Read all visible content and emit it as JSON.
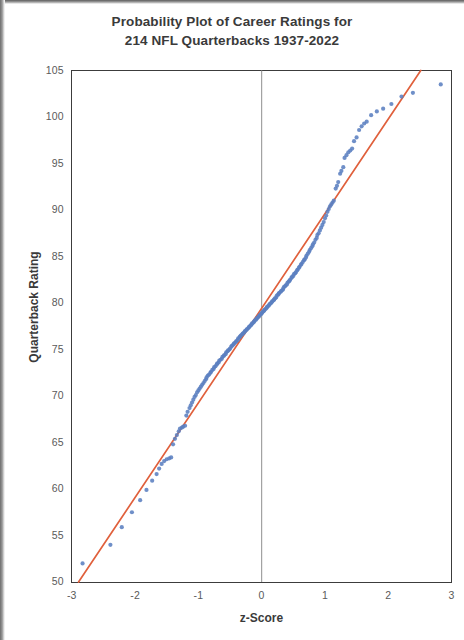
{
  "figure": {
    "title_line_1": "Probability Plot of Career Ratings for",
    "title_line_2": "214 NFL Quarterbacks 1937-2022"
  },
  "axes": {
    "x_label": "z-Score",
    "y_label": "Quarterback Rating",
    "x_ticks": [
      "-3",
      "-2",
      "-1",
      "0",
      "1",
      "2",
      "3"
    ],
    "y_ticks": [
      "105",
      "100",
      "95",
      "90",
      "85",
      "80",
      "75",
      "70",
      "65",
      "60",
      "55",
      "50"
    ]
  },
  "colors": {
    "points": "#5b7fc0",
    "reference_line": "#e0603c",
    "axis": "#3c3c3c",
    "zero_line": "#9a9a9a",
    "text": "#3a3a3a",
    "tick_text": "#5a5a5a",
    "background": "#ffffff"
  },
  "chart_data": {
    "type": "scatter",
    "title": "Probability Plot of Career Ratings for 214 NFL Quarterbacks 1937-2022",
    "xlabel": "z-Score",
    "ylabel": "Quarterback Rating",
    "xlim": [
      -3,
      3
    ],
    "ylim": [
      50,
      105
    ],
    "xticks": [
      -3,
      -2,
      -1,
      0,
      1,
      2,
      3
    ],
    "yticks": [
      50,
      55,
      60,
      65,
      70,
      75,
      80,
      85,
      90,
      95,
      100,
      105
    ],
    "grid": false,
    "legend": "none",
    "n_points": 214,
    "annotations": [
      {
        "kind": "vertical-line",
        "x": 0,
        "color": "#9a9a9a",
        "label": ""
      },
      {
        "kind": "reference-line",
        "description": "Fitted normal reference line passing through approximately (-2.75, 50) and (2.45, 105)",
        "color": "#e0603c"
      }
    ],
    "series": [
      {
        "name": "Career Passer Rating",
        "marker": "circle",
        "color": "#5b7fc0",
        "x": [
          -2.83,
          -2.39,
          -2.21,
          -2.05,
          -1.92,
          -1.82,
          -1.73,
          -1.66,
          -1.62,
          -1.58,
          -1.54,
          -1.5,
          -1.46,
          -1.43,
          -1.4,
          -1.37,
          -1.34,
          -1.31,
          -1.29,
          -1.26,
          -1.24,
          -1.21,
          -1.19,
          -1.17,
          -1.14,
          -1.12,
          -1.1,
          -1.08,
          -1.06,
          -1.04,
          -1.02,
          -1.0,
          -0.98,
          -0.96,
          -0.94,
          -0.92,
          -0.9,
          -0.88,
          -0.87,
          -0.85,
          -0.83,
          -0.81,
          -0.8,
          -0.78,
          -0.76,
          -0.75,
          -0.73,
          -0.71,
          -0.7,
          -0.68,
          -0.67,
          -0.65,
          -0.63,
          -0.62,
          -0.6,
          -0.59,
          -0.57,
          -0.56,
          -0.54,
          -0.53,
          -0.51,
          -0.5,
          -0.48,
          -0.47,
          -0.45,
          -0.44,
          -0.43,
          -0.41,
          -0.4,
          -0.38,
          -0.37,
          -0.35,
          -0.34,
          -0.33,
          -0.31,
          -0.3,
          -0.28,
          -0.27,
          -0.26,
          -0.24,
          -0.23,
          -0.21,
          -0.2,
          -0.19,
          -0.17,
          -0.16,
          -0.15,
          -0.13,
          -0.12,
          -0.11,
          -0.09,
          -0.08,
          -0.07,
          -0.05,
          -0.04,
          -0.03,
          -0.01,
          0.0,
          0.01,
          0.03,
          0.04,
          0.05,
          0.07,
          0.08,
          0.09,
          0.11,
          0.12,
          0.13,
          0.15,
          0.16,
          0.17,
          0.19,
          0.2,
          0.21,
          0.23,
          0.24,
          0.26,
          0.27,
          0.28,
          0.3,
          0.31,
          0.33,
          0.34,
          0.35,
          0.37,
          0.38,
          0.4,
          0.41,
          0.43,
          0.44,
          0.45,
          0.47,
          0.48,
          0.5,
          0.51,
          0.53,
          0.54,
          0.56,
          0.57,
          0.59,
          0.6,
          0.62,
          0.63,
          0.65,
          0.67,
          0.68,
          0.7,
          0.71,
          0.73,
          0.75,
          0.76,
          0.78,
          0.8,
          0.81,
          0.83,
          0.85,
          0.87,
          0.88,
          0.9,
          0.92,
          0.94,
          0.96,
          0.98,
          1.0,
          1.02,
          1.04,
          1.06,
          1.08,
          1.1,
          1.12,
          1.14,
          1.17,
          1.19,
          1.21,
          1.24,
          1.26,
          1.29,
          1.31,
          1.34,
          1.37,
          1.4,
          1.43,
          1.46,
          1.5,
          1.54,
          1.58,
          1.62,
          1.66,
          1.73,
          1.82,
          1.92,
          2.05,
          2.21,
          2.39,
          2.83
        ],
        "y": [
          52.0,
          54.0,
          55.9,
          57.5,
          58.8,
          59.9,
          60.9,
          61.6,
          62.2,
          62.7,
          63.0,
          63.2,
          63.3,
          63.4,
          64.8,
          65.4,
          65.8,
          66.2,
          66.5,
          66.6,
          66.7,
          66.8,
          67.9,
          68.3,
          68.7,
          69.0,
          69.3,
          69.6,
          69.9,
          70.1,
          70.4,
          70.6,
          70.8,
          71.0,
          71.2,
          71.4,
          71.6,
          71.8,
          72.0,
          72.2,
          72.3,
          72.5,
          72.6,
          72.8,
          72.9,
          73.1,
          73.2,
          73.4,
          73.5,
          73.6,
          73.8,
          73.9,
          74.0,
          74.2,
          74.3,
          74.4,
          74.5,
          74.7,
          74.8,
          74.9,
          75.0,
          75.1,
          75.3,
          75.4,
          75.5,
          75.6,
          75.7,
          75.8,
          75.9,
          76.0,
          76.2,
          76.3,
          76.4,
          76.5,
          76.6,
          76.7,
          76.8,
          76.9,
          77.0,
          77.1,
          77.2,
          77.3,
          77.4,
          77.5,
          77.6,
          77.7,
          77.8,
          77.9,
          78.0,
          78.1,
          78.2,
          78.3,
          78.4,
          78.5,
          78.6,
          78.7,
          78.8,
          78.9,
          79.0,
          79.1,
          79.2,
          79.3,
          79.4,
          79.5,
          79.6,
          79.7,
          79.8,
          79.9,
          80.0,
          80.1,
          80.2,
          80.3,
          80.4,
          80.5,
          80.6,
          80.8,
          80.9,
          81.0,
          81.1,
          81.2,
          81.3,
          81.4,
          81.5,
          81.7,
          81.8,
          81.9,
          82.0,
          82.2,
          82.3,
          82.4,
          82.5,
          82.7,
          82.8,
          82.9,
          83.1,
          83.2,
          83.3,
          83.5,
          83.6,
          83.8,
          83.9,
          84.1,
          84.2,
          84.4,
          84.6,
          84.7,
          84.9,
          85.1,
          85.3,
          85.5,
          85.7,
          85.9,
          86.1,
          86.3,
          86.5,
          86.8,
          87.0,
          87.3,
          87.5,
          87.8,
          88.1,
          88.4,
          88.7,
          89.1,
          89.4,
          89.8,
          90.1,
          90.4,
          90.6,
          90.8,
          91.0,
          92.3,
          92.6,
          93.0,
          93.9,
          94.2,
          94.6,
          95.6,
          95.9,
          96.2,
          96.4,
          96.6,
          97.4,
          97.8,
          98.6,
          99.0,
          99.3,
          99.5,
          100.2,
          100.6,
          100.9,
          101.4,
          102.2,
          102.6,
          103.5
        ]
      }
    ]
  }
}
